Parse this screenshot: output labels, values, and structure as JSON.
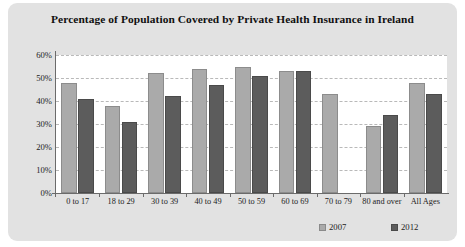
{
  "panel": {
    "background_color": "#e2e2e2",
    "plot_background_color": "#ffffff"
  },
  "legend": {
    "position": "bottom-right",
    "entries": [
      {
        "label": "2007",
        "color": "#aaaaaa",
        "swatch_name": "legend-swatch-2007"
      },
      {
        "label": "2012",
        "color": "#5c5c5c",
        "swatch_name": "legend-swatch-2012"
      }
    ]
  },
  "chart_data": {
    "type": "bar",
    "title": "Percentage of Population Covered by Private Health Insurance in Ireland",
    "xlabel": "",
    "ylabel": "",
    "ylim": [
      0,
      60
    ],
    "ytick_labels": [
      "60%",
      "50%",
      "40%",
      "30%",
      "20%",
      "10%",
      "0%"
    ],
    "ytick_values": [
      60,
      50,
      40,
      30,
      20,
      10,
      0
    ],
    "grid": true,
    "grid_style": "dashed horizontal",
    "legend_position": "bottom-right",
    "categories": [
      "0 to 17",
      "18 to 29",
      "30 to 39",
      "40 to 49",
      "50 to 59",
      "60 to 69",
      "70 to 79",
      "80 and over",
      "All Ages"
    ],
    "series": [
      {
        "name": "2007",
        "color": "#aaaaaa",
        "values": [
          48,
          38,
          52,
          54,
          55,
          53,
          43,
          29,
          48
        ]
      },
      {
        "name": "2012",
        "color": "#5c5c5c",
        "values": [
          41,
          31,
          42,
          47,
          51,
          53,
          0,
          34,
          43
        ]
      }
    ]
  }
}
